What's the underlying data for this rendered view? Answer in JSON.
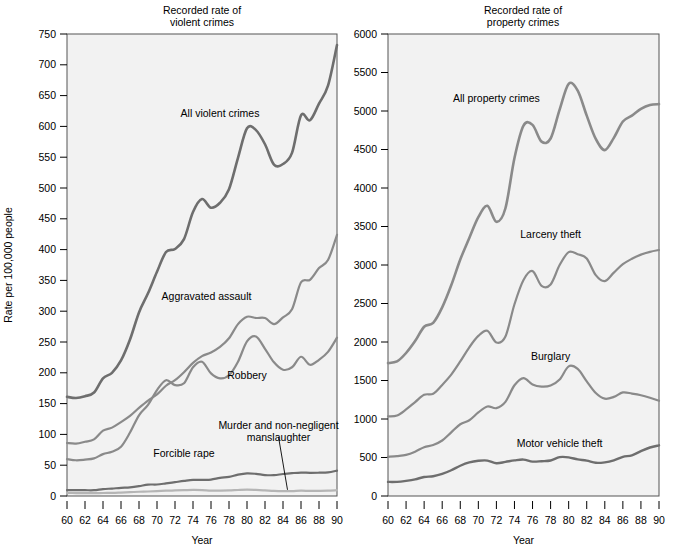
{
  "figure": {
    "background_color": "#ffffff",
    "plot_background_color": "#f2f2f2",
    "frame_color": "#555555"
  },
  "chart_data": [
    {
      "type": "line",
      "id": "violent",
      "title": "Recorded rate of\nviolent crimes",
      "title_line1": "Recorded rate of",
      "title_line2": "violent crimes",
      "xlabel": "Year",
      "ylabel": "Rate per 100,000 people",
      "xlim": [
        60,
        90
      ],
      "ylim": [
        0,
        750
      ],
      "xticks": [
        60,
        62,
        64,
        66,
        68,
        70,
        72,
        74,
        76,
        78,
        80,
        82,
        84,
        86,
        88,
        90
      ],
      "xticklabels": [
        "60",
        "62",
        "64",
        "66",
        "68",
        "70",
        "72",
        "74",
        "76",
        "78",
        "80",
        "82",
        "84",
        "86",
        "88",
        "90"
      ],
      "yticks": [
        0,
        50,
        100,
        150,
        200,
        250,
        300,
        350,
        400,
        450,
        500,
        550,
        600,
        650,
        700,
        750
      ],
      "yticklabels": [
        "0",
        "50",
        "100",
        "150",
        "200",
        "250",
        "300",
        "350",
        "400",
        "450",
        "500",
        "550",
        "600",
        "650",
        "700",
        "750"
      ],
      "grid": false,
      "legend_position": "inline-annotations",
      "x": [
        60,
        61,
        62,
        63,
        64,
        65,
        66,
        67,
        68,
        69,
        70,
        71,
        72,
        73,
        74,
        75,
        76,
        77,
        78,
        79,
        80,
        81,
        82,
        83,
        84,
        85,
        86,
        87,
        88,
        89,
        90
      ],
      "series": [
        {
          "name": "All violent crimes",
          "color": "#6e6e6e",
          "linewidth": 2.6,
          "label_x": 77.0,
          "label_y": 615,
          "values": [
            161,
            159,
            162,
            168,
            191,
            200,
            220,
            254,
            298,
            329,
            364,
            396,
            401,
            417,
            461,
            482,
            468,
            476,
            498,
            549,
            597,
            594,
            571,
            538,
            539,
            557,
            618,
            610,
            637,
            666,
            732
          ]
        },
        {
          "name": "Aggravated assault",
          "color": "#8a8a8a",
          "linewidth": 2.2,
          "label_x": 75.5,
          "label_y": 318,
          "values": [
            86,
            85,
            88,
            92,
            106,
            111,
            120,
            130,
            143,
            155,
            165,
            179,
            188,
            201,
            216,
            227,
            233,
            242,
            256,
            279,
            291,
            289,
            289,
            279,
            290,
            303,
            347,
            351,
            370,
            383,
            424
          ]
        },
        {
          "name": "Robbery",
          "color": "#8a8a8a",
          "linewidth": 2.2,
          "label_x": 80.0,
          "label_y": 190,
          "values": [
            60,
            58,
            59,
            61,
            68,
            72,
            80,
            103,
            131,
            148,
            172,
            188,
            180,
            183,
            209,
            218,
            199,
            191,
            196,
            218,
            251,
            259,
            239,
            217,
            205,
            209,
            226,
            213,
            221,
            234,
            257
          ]
        },
        {
          "name": "Forcible rape",
          "color": "#6e6e6e",
          "linewidth": 2.2,
          "label_x": 73.0,
          "label_y": 63,
          "values": [
            9.6,
            9.4,
            9.4,
            9.4,
            11.2,
            12.1,
            13.2,
            14.0,
            15.9,
            18.5,
            18.7,
            20.5,
            22.5,
            24.5,
            26.2,
            26.3,
            26.6,
            29.4,
            31.0,
            34.7,
            36.8,
            36.0,
            34.0,
            33.8,
            35.7,
            37.1,
            38.1,
            37.6,
            37.8,
            38.3,
            41.2
          ]
        },
        {
          "name": "Murder and non-negligent manslaughter",
          "color": "#b5b5b5",
          "linewidth": 2.2,
          "label_x": 83.5,
          "label_y": 108,
          "label_line1": "Murder and non-negligent",
          "label_line2": "manslaughter",
          "leader_from_x": 83.5,
          "leader_from_y": 96,
          "leader_to_x": 84.5,
          "leader_to_y": 10,
          "values": [
            5.1,
            4.8,
            4.6,
            4.6,
            4.9,
            5.1,
            5.6,
            6.2,
            6.9,
            7.3,
            7.9,
            8.6,
            9.0,
            9.4,
            9.8,
            9.6,
            8.8,
            8.8,
            9.0,
            9.7,
            10.2,
            9.8,
            9.1,
            8.3,
            7.9,
            7.9,
            8.6,
            8.3,
            8.4,
            8.7,
            9.4
          ]
        }
      ]
    },
    {
      "type": "line",
      "id": "property",
      "title": "Recorded rate of\nproperty crimes",
      "title_line1": "Recorded rate of",
      "title_line2": "property crimes",
      "xlabel": "Year",
      "ylabel": "",
      "xlim": [
        60,
        90
      ],
      "ylim": [
        0,
        6000
      ],
      "xticks": [
        60,
        62,
        64,
        66,
        68,
        70,
        72,
        74,
        76,
        78,
        80,
        82,
        84,
        86,
        88,
        90
      ],
      "xticklabels": [
        "60",
        "62",
        "64",
        "66",
        "68",
        "70",
        "72",
        "74",
        "76",
        "78",
        "80",
        "82",
        "84",
        "86",
        "88",
        "90"
      ],
      "yticks": [
        0,
        500,
        1000,
        1500,
        2000,
        2500,
        3000,
        3500,
        4000,
        4500,
        5000,
        5500,
        6000
      ],
      "yticklabels": [
        "0",
        "500",
        "1000",
        "1500",
        "2000",
        "2500",
        "3000",
        "3500",
        "4000",
        "4500",
        "5000",
        "5500",
        "6000"
      ],
      "grid": false,
      "legend_position": "inline-annotations",
      "x": [
        60,
        61,
        62,
        63,
        64,
        65,
        66,
        67,
        68,
        69,
        70,
        71,
        72,
        73,
        74,
        75,
        76,
        77,
        78,
        79,
        80,
        81,
        82,
        83,
        84,
        85,
        86,
        87,
        88,
        89,
        90
      ],
      "series": [
        {
          "name": "All property crimes",
          "color": "#8a8a8a",
          "linewidth": 2.6,
          "label_x": 72.0,
          "label_y": 5120,
          "values": [
            1726,
            1747,
            1857,
            2012,
            2198,
            2249,
            2450,
            2736,
            3071,
            3351,
            3621,
            3769,
            3561,
            3737,
            4390,
            4810,
            4820,
            4602,
            4643,
            5017,
            5353,
            5264,
            4940,
            4637,
            4492,
            4651,
            4863,
            4940,
            5027,
            5078,
            5089
          ]
        },
        {
          "name": "Larceny theft",
          "color": "#8a8a8a",
          "linewidth": 2.2,
          "label_x": 78.0,
          "label_y": 3350,
          "values": [
            1035,
            1045,
            1124,
            1219,
            1315,
            1329,
            1443,
            1576,
            1747,
            1931,
            2079,
            2146,
            1994,
            2072,
            2490,
            2805,
            2921,
            2730,
            2747,
            2999,
            3167,
            3140,
            3085,
            2869,
            2791,
            2901,
            3010,
            3081,
            3135,
            3171,
            3195
          ]
        },
        {
          "name": "Burglary",
          "color": "#8a8a8a",
          "linewidth": 2.2,
          "label_x": 78.0,
          "label_y": 1760,
          "values": [
            509,
            519,
            535,
            576,
            634,
            663,
            721,
            827,
            932,
            984,
            1085,
            1163,
            1141,
            1223,
            1438,
            1532,
            1448,
            1420,
            1434,
            1512,
            1684,
            1650,
            1489,
            1338,
            1264,
            1287,
            1345,
            1330,
            1309,
            1276,
            1236
          ]
        },
        {
          "name": "Motor vehicle theft",
          "color": "#6e6e6e",
          "linewidth": 2.4,
          "label_x": 79.0,
          "label_y": 640,
          "values": [
            183,
            184,
            197,
            216,
            247,
            257,
            286,
            334,
            393,
            436,
            457,
            460,
            426,
            443,
            462,
            473,
            447,
            452,
            461,
            505,
            502,
            475,
            459,
            431,
            437,
            463,
            508,
            529,
            583,
            630,
            658
          ]
        }
      ]
    }
  ]
}
